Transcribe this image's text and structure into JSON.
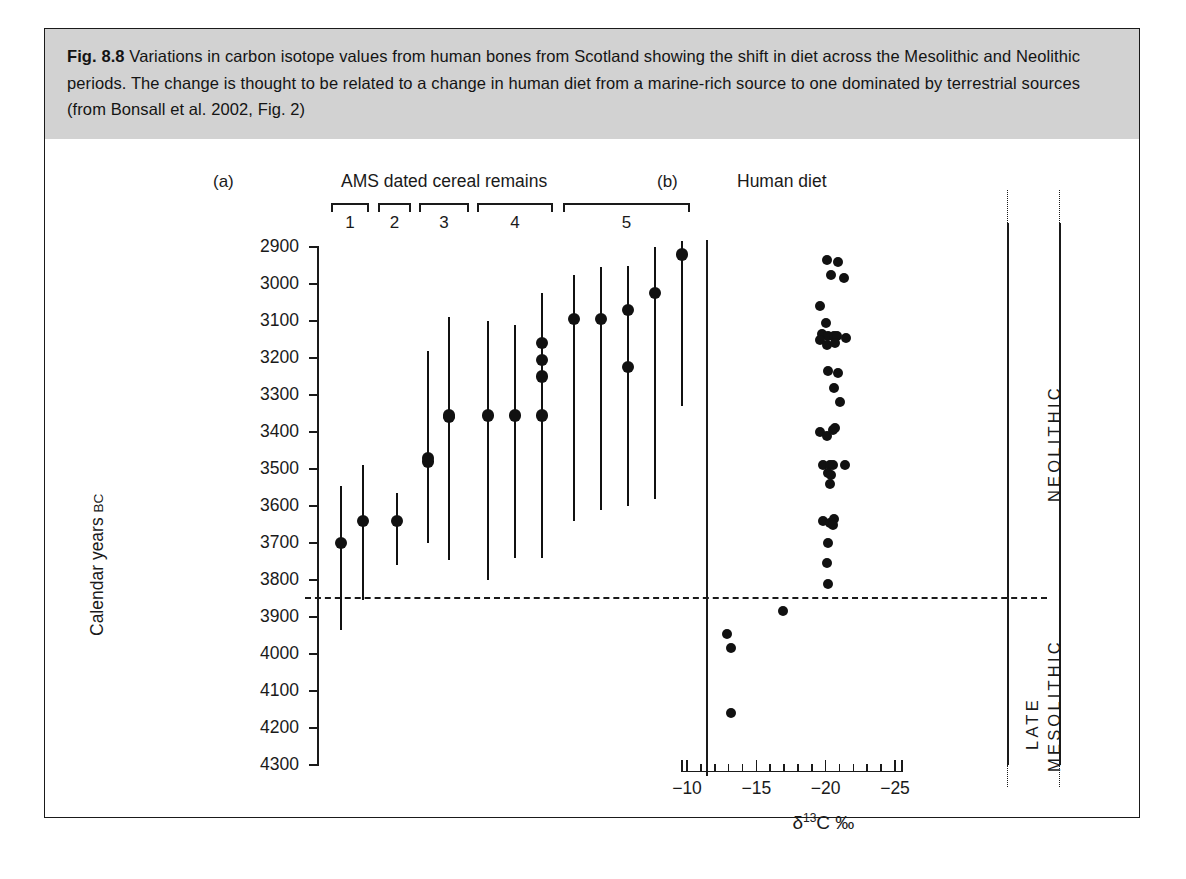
{
  "caption": {
    "fig_label": "Fig. 8.8",
    "text": "Variations in carbon isotope values from human bones from Scotland showing the shift in diet across the Mesolithic and Neolithic periods. The change is thought to be related to a change in human diet from a marine-rich source to one dominated by terrestrial sources (from Bonsall et al. 2002, Fig. 2)"
  },
  "chart_data": {
    "type": "scatter",
    "title": "Variations in carbon isotope values from human bones from Scotland",
    "panels": [
      {
        "tag": "(a)",
        "title": "AMS dated cereal remains",
        "ylabel": "Calendar years BC",
        "ylabel_prefix": "Calendar years ",
        "ylabel_suffix": "BC",
        "ylim": [
          2900,
          4300
        ],
        "yticks": [
          2900,
          3000,
          3100,
          3200,
          3300,
          3400,
          3500,
          3600,
          3700,
          3800,
          3900,
          4000,
          4100,
          4200,
          4300
        ],
        "y_reversed": true,
        "groups": [
          {
            "label": "1",
            "count": 2
          },
          {
            "label": "2",
            "count": 1
          },
          {
            "label": "3",
            "count": 2
          },
          {
            "label": "4",
            "count": 2
          },
          {
            "label": "5",
            "count": 8
          }
        ],
        "series_name": "AMS dated cereal remains (calibrated ranges)",
        "points": [
          {
            "group": "1",
            "index": 1,
            "date": 3700,
            "range_low": 3935,
            "range_high": 3545
          },
          {
            "group": "1",
            "index": 2,
            "date": 3640,
            "range_low": 3855,
            "range_high": 3490
          },
          {
            "group": "2",
            "index": 1,
            "date": 3640,
            "range_low": 3760,
            "range_high": 3565
          },
          {
            "group": "3",
            "index": 1,
            "date": 3470,
            "range_low": 3700,
            "range_high": 3215
          },
          {
            "group": "3",
            "index": 2,
            "date": 3480,
            "range_low": 3425,
            "range_high": 3180
          },
          {
            "group": "3",
            "index": 3,
            "date": 3360,
            "range_low": 3700,
            "range_high": 3215
          },
          {
            "group": "3",
            "index": 4,
            "date": 3355,
            "range_low": 3745,
            "range_high": 3090
          },
          {
            "group": "4",
            "index": 1,
            "date": 3355,
            "range_low": 3800,
            "range_high": 3100
          },
          {
            "group": "4",
            "index": 2,
            "date": 3355,
            "range_low": 3740,
            "range_high": 3110
          },
          {
            "group": "5",
            "index": 1,
            "date": 3355,
            "range_low": 3740,
            "range_high": 3025
          },
          {
            "group": "5",
            "index": 2,
            "date": 3250,
            "range_low": 3740,
            "range_high": 3025
          },
          {
            "group": "5",
            "index": 3,
            "date": 3205,
            "range_low": 3740,
            "range_high": 3025
          },
          {
            "group": "5",
            "index": 4,
            "date": 3160,
            "range_low": 3740,
            "range_high": 3025
          },
          {
            "group": "5",
            "index": 5,
            "date": 3095,
            "range_low": 3640,
            "range_high": 2975
          },
          {
            "group": "5",
            "index": 6,
            "date": 3095,
            "range_low": 3610,
            "range_high": 2955
          },
          {
            "group": "5",
            "index": 7,
            "date": 3225,
            "range_low": 3600,
            "range_high": 2950
          },
          {
            "group": "5",
            "index": 8,
            "date": 3070,
            "range_low": 3600,
            "range_high": 2950
          },
          {
            "group": "5",
            "index": 9,
            "date": 3025,
            "range_low": 3580,
            "range_high": 2900
          },
          {
            "group": "5",
            "index": 10,
            "date": 2920,
            "range_low": 3330,
            "range_high": 2885
          }
        ]
      },
      {
        "tag": "(b)",
        "title": "Human diet",
        "xlabel": "δ13C ‰",
        "xlabel_delta": "δ",
        "xlabel_sup": "13",
        "xlabel_rest": "C ‰",
        "xlim": [
          -10,
          -25
        ],
        "xticks": [
          -10,
          -15,
          -20,
          -25
        ],
        "x_reversed": true,
        "minor_tick_step": 1,
        "series_name": "Human bone δ13C",
        "points": [
          {
            "d13c": -20.1,
            "year": 2935
          },
          {
            "d13c": -20.9,
            "year": 2940
          },
          {
            "d13c": -20.4,
            "year": 2975
          },
          {
            "d13c": -21.3,
            "year": 2985
          },
          {
            "d13c": -19.6,
            "year": 3060
          },
          {
            "d13c": -20.0,
            "year": 3105
          },
          {
            "d13c": -19.7,
            "year": 3135
          },
          {
            "d13c": -20.2,
            "year": 3140
          },
          {
            "d13c": -20.6,
            "year": 3140
          },
          {
            "d13c": -20.8,
            "year": 3140
          },
          {
            "d13c": -19.6,
            "year": 3150
          },
          {
            "d13c": -21.5,
            "year": 3145
          },
          {
            "d13c": -20.1,
            "year": 3165
          },
          {
            "d13c": -20.7,
            "year": 3160
          },
          {
            "d13c": -20.2,
            "year": 3235
          },
          {
            "d13c": -20.9,
            "year": 3240
          },
          {
            "d13c": -20.6,
            "year": 3280
          },
          {
            "d13c": -21.0,
            "year": 3320
          },
          {
            "d13c": -19.6,
            "year": 3400
          },
          {
            "d13c": -20.1,
            "year": 3410
          },
          {
            "d13c": -20.5,
            "year": 3395
          },
          {
            "d13c": -20.7,
            "year": 3390
          },
          {
            "d13c": -19.8,
            "year": 3490
          },
          {
            "d13c": -20.3,
            "year": 3490
          },
          {
            "d13c": -20.5,
            "year": 3490
          },
          {
            "d13c": -21.4,
            "year": 3490
          },
          {
            "d13c": -20.2,
            "year": 3510
          },
          {
            "d13c": -20.4,
            "year": 3515
          },
          {
            "d13c": -20.3,
            "year": 3540
          },
          {
            "d13c": -19.8,
            "year": 3640
          },
          {
            "d13c": -20.3,
            "year": 3645
          },
          {
            "d13c": -20.6,
            "year": 3635
          },
          {
            "d13c": -20.5,
            "year": 3650
          },
          {
            "d13c": -20.2,
            "year": 3700
          },
          {
            "d13c": -20.1,
            "year": 3755
          },
          {
            "d13c": -20.2,
            "year": 3810
          },
          {
            "d13c": -16.9,
            "year": 3885
          },
          {
            "d13c": -12.9,
            "year": 3945
          },
          {
            "d13c": -13.2,
            "year": 3985
          },
          {
            "d13c": -13.2,
            "year": 4160
          }
        ]
      }
    ],
    "transition": {
      "year": 3845,
      "style": "dashed",
      "above_label": "NEOLITHIC",
      "below_label_line1": "LATE",
      "below_label_line2": "MESOLITHIC"
    },
    "periods": {
      "neolithic": "NEOLITHIC",
      "late": "LATE",
      "mesolithic": "MESOLITHIC"
    }
  }
}
